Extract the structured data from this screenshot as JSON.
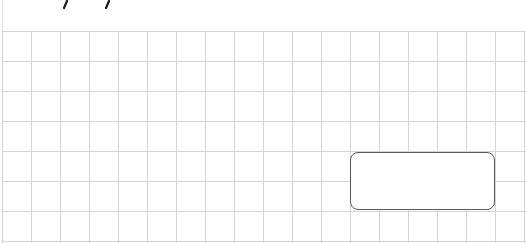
{
  "worksheet": {
    "type": "grid-paper",
    "grid": {
      "columns": 18,
      "rows": 7,
      "cell_width_px": 29,
      "cell_height_px": 30,
      "line_color": "#d4d4d4"
    },
    "top_marks": [
      {
        "glyph": "/",
        "x": 65
      },
      {
        "glyph": "/",
        "x": 107
      }
    ],
    "answer_box": {
      "value": "",
      "border_color": "#5a5a5a"
    }
  }
}
